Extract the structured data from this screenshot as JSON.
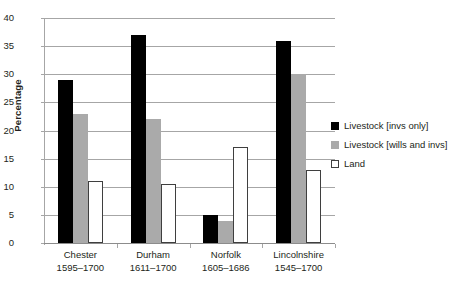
{
  "chart_data": {
    "type": "bar",
    "title": "",
    "xlabel": "",
    "ylabel": "Percentage",
    "ylim": [
      0,
      40
    ],
    "ytick_step": 5,
    "yticks": [
      "40",
      "35",
      "30",
      "25",
      "20",
      "15",
      "10",
      "5",
      "0"
    ],
    "grid": "horizontal",
    "legend_position": "right",
    "categories": [
      {
        "name": "Chester",
        "period": "1595–1700"
      },
      {
        "name": "Durham",
        "period": "1611–1700"
      },
      {
        "name": "Norfolk",
        "period": "1605–1686"
      },
      {
        "name": "Lincolnshire",
        "period": "1545–1700"
      }
    ],
    "series": [
      {
        "name": "Livestock [invs only]",
        "color": "#000000",
        "values": [
          29,
          37,
          5,
          36
        ]
      },
      {
        "name": "Livestock [wills and invs]",
        "color": "#aaaaaa",
        "values": [
          23,
          22,
          4,
          30
        ]
      },
      {
        "name": "Land",
        "color": "#ffffff",
        "values": [
          11,
          10.5,
          17,
          13
        ]
      }
    ]
  }
}
